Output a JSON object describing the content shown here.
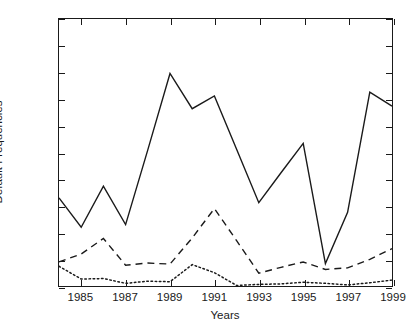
{
  "chart_data": {
    "type": "line",
    "title": "",
    "xlabel": "Years",
    "ylabel": "Default Frequencies",
    "xlim": [
      1984,
      1999
    ],
    "ylim": [
      0,
      0.5
    ],
    "grid": false,
    "legend": "none",
    "x": [
      1984,
      1985,
      1986,
      1987,
      1988,
      1989,
      1990,
      1991,
      1992,
      1993,
      1994,
      1995,
      1996,
      1997,
      1998,
      1999
    ],
    "xticks": [
      "1985",
      "1987",
      "1989",
      "1991",
      "1993",
      "1995",
      "1997",
      "1999"
    ],
    "xtick_values": [
      1985,
      1987,
      1989,
      1991,
      1993,
      1995,
      1997,
      1999
    ],
    "yticks": [
      "0",
      "0.05",
      "0.1",
      "0.15",
      "0.2",
      "0.25",
      "0.3",
      "0.35",
      "0.4",
      "0.45",
      "0.5"
    ],
    "ytick_values": [
      0,
      0.05,
      0.1,
      0.15,
      0.2,
      0.25,
      0.3,
      0.35,
      0.4,
      0.45,
      0.5
    ],
    "series": [
      {
        "name": "solid",
        "style": "solid",
        "color": "#1a1a1a",
        "values": [
          0.165,
          0.11,
          0.187,
          0.115,
          0.255,
          0.398,
          0.332,
          0.356,
          0.256,
          0.156,
          0.212,
          0.267,
          0.042,
          0.138,
          0.363,
          0.337
        ]
      },
      {
        "name": "dashed",
        "style": "dashed",
        "color": "#1a1a1a",
        "values": [
          0.045,
          0.06,
          0.089,
          0.039,
          0.043,
          0.041,
          0.09,
          0.145,
          0.085,
          0.024,
          0.035,
          0.045,
          0.031,
          0.034,
          0.05,
          0.07
        ]
      },
      {
        "name": "dotted",
        "style": "dotted",
        "color": "#1a1a1a",
        "values": [
          0.037,
          0.013,
          0.014,
          0.005,
          0.009,
          0.008,
          0.04,
          0.025,
          0.001,
          0.003,
          0.004,
          0.007,
          0.005,
          0.002,
          0.006,
          0.011
        ]
      }
    ]
  }
}
